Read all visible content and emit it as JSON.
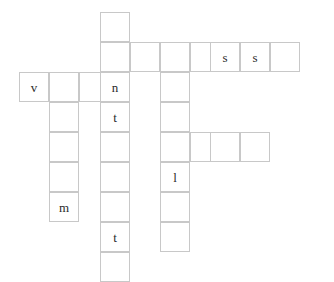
{
  "app": {
    "title": "Crossword Grid",
    "background_color": "#ffffff",
    "cell_border_color": "#c8c8c8",
    "cell_fill_color": "#ffffff",
    "letter_color": "#2b2b2b"
  },
  "grid": {
    "cell_size": 30,
    "origin_x": 19,
    "origin_y": 12,
    "columns": 10,
    "rows": 9,
    "column_x": [
      19,
      49,
      79,
      100,
      130,
      160,
      190,
      210,
      240,
      270
    ],
    "row_y": [
      12,
      42,
      72,
      102,
      132,
      162,
      192,
      222,
      252
    ]
  },
  "cells": [
    {
      "name": "cell-r0c3",
      "col": 3,
      "row": 0,
      "x": 100,
      "y": 12,
      "letter": ""
    },
    {
      "name": "cell-r1c3",
      "col": 3,
      "row": 1,
      "x": 100,
      "y": 42,
      "letter": ""
    },
    {
      "name": "cell-r1c4",
      "col": 4,
      "row": 1,
      "x": 130,
      "y": 42,
      "letter": ""
    },
    {
      "name": "cell-r1c5",
      "col": 5,
      "row": 1,
      "x": 160,
      "y": 42,
      "letter": ""
    },
    {
      "name": "cell-r1c6",
      "col": 6,
      "row": 1,
      "x": 190,
      "y": 42,
      "letter": ""
    },
    {
      "name": "cell-r1c7",
      "col": 7,
      "row": 1,
      "x": 210,
      "y": 42,
      "letter": "s"
    },
    {
      "name": "cell-r1c8",
      "col": 8,
      "row": 1,
      "x": 240,
      "y": 42,
      "letter": "s"
    },
    {
      "name": "cell-r1c9",
      "col": 9,
      "row": 1,
      "x": 270,
      "y": 42,
      "letter": ""
    },
    {
      "name": "cell-r2c0",
      "col": 0,
      "row": 2,
      "x": 19,
      "y": 72,
      "letter": "v"
    },
    {
      "name": "cell-r2c1",
      "col": 1,
      "row": 2,
      "x": 49,
      "y": 72,
      "letter": ""
    },
    {
      "name": "cell-r2c2",
      "col": 2,
      "row": 2,
      "x": 79,
      "y": 72,
      "letter": ""
    },
    {
      "name": "cell-r2c3",
      "col": 3,
      "row": 2,
      "x": 100,
      "y": 72,
      "letter": "n"
    },
    {
      "name": "cell-r2c5",
      "col": 5,
      "row": 2,
      "x": 160,
      "y": 72,
      "letter": ""
    },
    {
      "name": "cell-r3c1",
      "col": 1,
      "row": 3,
      "x": 49,
      "y": 102,
      "letter": ""
    },
    {
      "name": "cell-r3c3",
      "col": 3,
      "row": 3,
      "x": 100,
      "y": 102,
      "letter": "t"
    },
    {
      "name": "cell-r3c5",
      "col": 5,
      "row": 3,
      "x": 160,
      "y": 102,
      "letter": ""
    },
    {
      "name": "cell-r4c1",
      "col": 1,
      "row": 4,
      "x": 49,
      "y": 132,
      "letter": ""
    },
    {
      "name": "cell-r4c3",
      "col": 3,
      "row": 4,
      "x": 100,
      "y": 132,
      "letter": ""
    },
    {
      "name": "cell-r4c5",
      "col": 5,
      "row": 4,
      "x": 160,
      "y": 132,
      "letter": ""
    },
    {
      "name": "cell-r4c6",
      "col": 6,
      "row": 4,
      "x": 190,
      "y": 132,
      "letter": ""
    },
    {
      "name": "cell-r4c7",
      "col": 7,
      "row": 4,
      "x": 210,
      "y": 132,
      "letter": ""
    },
    {
      "name": "cell-r4c8",
      "col": 8,
      "row": 4,
      "x": 240,
      "y": 132,
      "letter": ""
    },
    {
      "name": "cell-r5c1",
      "col": 1,
      "row": 5,
      "x": 49,
      "y": 162,
      "letter": ""
    },
    {
      "name": "cell-r5c3",
      "col": 3,
      "row": 5,
      "x": 100,
      "y": 162,
      "letter": ""
    },
    {
      "name": "cell-r5c5",
      "col": 5,
      "row": 5,
      "x": 160,
      "y": 162,
      "letter": "l"
    },
    {
      "name": "cell-r6c1",
      "col": 1,
      "row": 6,
      "x": 49,
      "y": 192,
      "letter": "m"
    },
    {
      "name": "cell-r6c3",
      "col": 3,
      "row": 6,
      "x": 100,
      "y": 192,
      "letter": ""
    },
    {
      "name": "cell-r6c5",
      "col": 5,
      "row": 6,
      "x": 160,
      "y": 192,
      "letter": ""
    },
    {
      "name": "cell-r7c3",
      "col": 3,
      "row": 7,
      "x": 100,
      "y": 222,
      "letter": "t"
    },
    {
      "name": "cell-r7c5",
      "col": 5,
      "row": 7,
      "x": 160,
      "y": 222,
      "letter": ""
    },
    {
      "name": "cell-r8c3",
      "col": 3,
      "row": 8,
      "x": 100,
      "y": 252,
      "letter": ""
    }
  ],
  "letters_visible": [
    "s",
    "s",
    "v",
    "n",
    "t",
    "l",
    "m",
    "t"
  ]
}
